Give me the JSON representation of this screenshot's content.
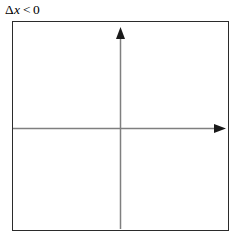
{
  "figure": {
    "width": 233,
    "height": 243,
    "background_color": "#ffffff"
  },
  "caption": {
    "full_text": "Δx < 0",
    "delta_symbol": "Δ",
    "variable": "x",
    "relation": "<",
    "value": "0",
    "color": "#000000"
  },
  "plot_box": {
    "border_color": "#2b2b2b",
    "fill_color": "#ffffff",
    "left": 12,
    "top": 21,
    "width": 217,
    "height": 210
  },
  "chart_data": {
    "type": "scatter",
    "subtitle": "",
    "xlabel": "",
    "ylabel": "",
    "xlim": [
      -1,
      1
    ],
    "ylim": [
      -1,
      1
    ],
    "grid": false,
    "legend": false,
    "legend_position": "none",
    "x": [],
    "y": [],
    "series": [],
    "annotations": [
      "Δx < 0"
    ],
    "axes": {
      "axis_color": "#7f7f7f",
      "arrowhead_color": "#1a1a1a",
      "x_axis": {
        "name": "horizontal-axis",
        "orientation": "horizontal",
        "y_position": 109,
        "start_x": 0,
        "end_x": 214,
        "arrow_at": "right",
        "tick_labels": []
      },
      "y_axis": {
        "name": "vertical-axis",
        "orientation": "vertical",
        "x_position": 108,
        "start_y": 210,
        "end_y": 6,
        "arrow_at": "top",
        "tick_labels": []
      },
      "origin": {
        "x": 108,
        "y": 109
      }
    }
  }
}
